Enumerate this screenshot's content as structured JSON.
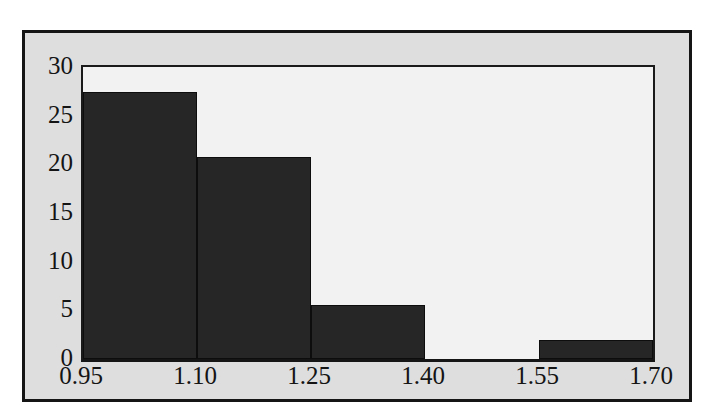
{
  "chart_data": {
    "type": "bar",
    "title": "",
    "subtitle": "",
    "xlabel": "",
    "ylabel": "",
    "categories": [
      "0.95-1.10",
      "1.10-1.25",
      "1.25-1.40",
      "1.40-1.55",
      "1.55-1.70"
    ],
    "bin_edges": [
      0.95,
      1.1,
      1.25,
      1.4,
      1.55,
      1.7
    ],
    "values": [
      27.4,
      20.8,
      5.5,
      0,
      2
    ],
    "xlim": [
      0.95,
      1.7
    ],
    "ylim": [
      0,
      30
    ],
    "x_tick_labels": [
      "0.95",
      "1.10",
      "1.25",
      "1.40",
      "1.55",
      "1.70"
    ],
    "x_tick_values": [
      0.95,
      1.1,
      1.25,
      1.4,
      1.55,
      1.7
    ],
    "y_tick_labels": [
      "0",
      "5",
      "10",
      "15",
      "20",
      "25",
      "30"
    ],
    "y_tick_values": [
      0,
      5,
      10,
      15,
      20,
      25,
      30
    ],
    "grid": false,
    "legend": null,
    "legend_position": "none",
    "annotations": [],
    "series": [
      {
        "name": "frequency",
        "values": [
          27.4,
          20.8,
          5.5,
          0,
          2
        ]
      }
    ]
  },
  "style": {
    "bar_color": "#262626",
    "bar_edge_color": "#0d0d0d",
    "plot_background": "#f2f2f2",
    "figure_background": "#dedede",
    "page_background": "#ffffff",
    "axis_color": "#1a1a1a",
    "frame_color": "#151515",
    "text_color": "#141414"
  }
}
